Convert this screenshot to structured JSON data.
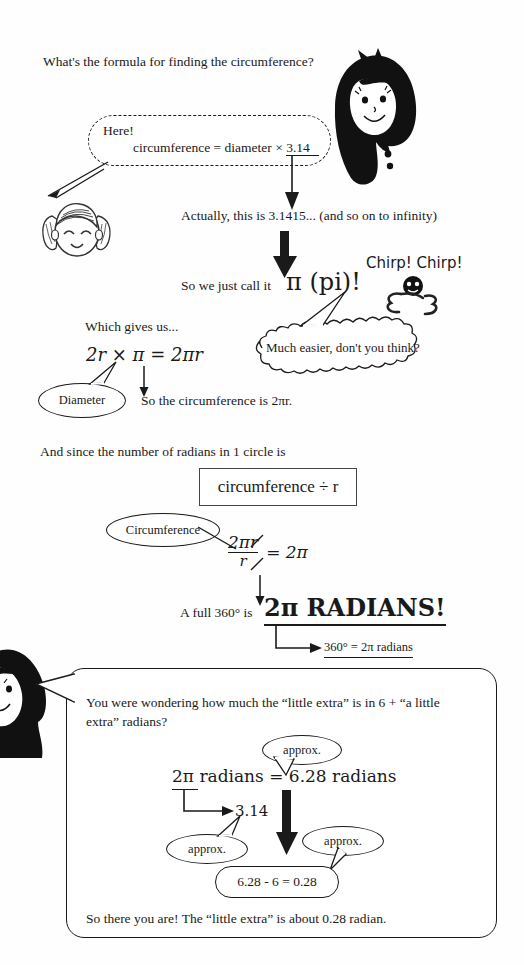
{
  "page": {
    "kind": "scanned-textbook-page",
    "topic": "circumference, pi and radians",
    "ink_color": "#1a1a1a",
    "paper_color": "#fefefe"
  },
  "lines": {
    "q1": "What's the formula for finding the circumference?",
    "here": "Here!",
    "formula1": "circumference = diameter × 3.14",
    "formula1_underlined_part": "3.14",
    "actually": "Actually, this is 3.1415... (and so on to infinity)",
    "sowecall": "So we just call it",
    "pi_big": "π (pi)!",
    "chirp": "Chirp! Chirp!",
    "whichgives": "Which gives us...",
    "eq_2rpi": "2r × π = 2πr",
    "diameter": "Diameter",
    "mucheasier": "Much easier, don't you think?",
    "socircum": "So the circumference is 2πr.",
    "andsince": "And since the number of radians in 1 circle is",
    "boxed_circ_div_r": "circumference ÷ r",
    "circumference_label": "Circumference",
    "frac_num": "2πr",
    "frac_den": "r",
    "frac_eq": "= 2π",
    "afull360": "A full 360° is",
    "radians_big": "2π RADIANS!",
    "eq_360": "360° = 2π radians"
  },
  "panel": {
    "intro_line1": "You were wondering how much the “little extra” is in 6 + “a little",
    "intro_line2": "extra” radians?",
    "approx1": "approx.",
    "eq_main": "2π radians = 6.28 radians",
    "eq_main_underlined_part": "2π",
    "val_314": "3.14",
    "approx2": "approx.",
    "approx3": "approx.",
    "result": "6.28 - 6 = 0.28",
    "closing": "So there you are!  The “little extra” is about 0.28 radian."
  },
  "characters": [
    {
      "id": "girl-black-hair-top",
      "name": "girl-with-long-black-hair",
      "position": "top-right"
    },
    {
      "id": "girl-pigtails",
      "name": "smiling-girl-with-pigtails",
      "position": "upper-left"
    },
    {
      "id": "bird",
      "name": "chirping-bird",
      "position": "middle-right"
    },
    {
      "id": "girl-black-hair-bottom",
      "name": "girl-with-long-black-hair",
      "position": "bottom-left"
    }
  ]
}
